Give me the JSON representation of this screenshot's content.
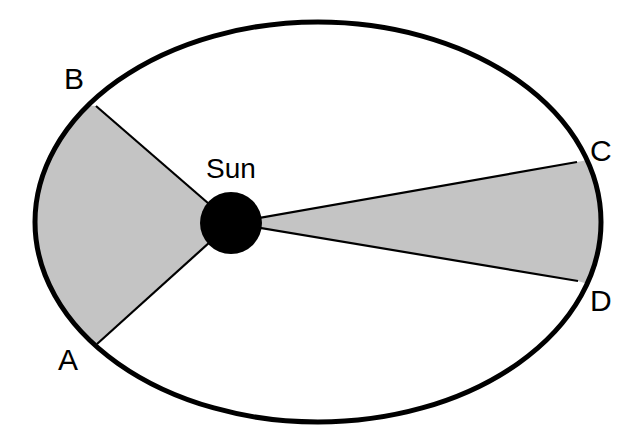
{
  "diagram": {
    "sun_label": "Sun",
    "points": {
      "A": "A",
      "B": "B",
      "C": "C",
      "D": "D"
    },
    "colors": {
      "orbit": "#000000",
      "sun": "#000000",
      "sweep_fill": "#c4c4c4",
      "background": "#ffffff"
    }
  }
}
